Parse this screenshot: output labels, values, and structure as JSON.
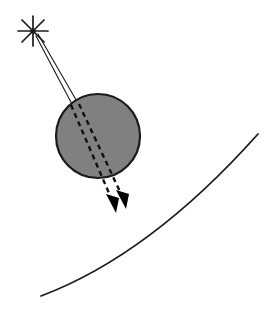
{
  "figure": {
    "name": "ray-diagram-star-body-surface",
    "background_color": "#ffffff",
    "width": 275,
    "height": 310
  },
  "colors": {
    "stroke": "#1a1a1a",
    "body_fill": "#808080",
    "body_stroke": "#1a1a1a",
    "arrowhead_fill": "#000000",
    "background": "#ffffff"
  },
  "star_source": {
    "label": "star-source",
    "center_x": 33,
    "center_y": 31,
    "ray_count": 8,
    "ray_length": 15,
    "stroke_width": 1.6,
    "ray_angles_deg": [
      0,
      45,
      90,
      135,
      180,
      225,
      270,
      315
    ]
  },
  "incident_rays": {
    "label": "incident-light-rays",
    "count": 2,
    "stroke_width": 1.1,
    "ray_a": {
      "x1": 36,
      "y1": 36,
      "x2": 73,
      "y2": 106
    },
    "ray_b": {
      "x1": 38,
      "y1": 34,
      "x2": 79,
      "y2": 105
    }
  },
  "body": {
    "label": "spherical-body",
    "center_x": 98,
    "center_y": 136,
    "radius": 42,
    "fill": "#808080",
    "stroke_width": 2.2
  },
  "refracted_rays": {
    "label": "refracted-dashed-rays",
    "count": 2,
    "stroke_width": 2.4,
    "dash_pattern": "5,4",
    "ray_a": {
      "x1": 71,
      "y1": 105,
      "x2": 114,
      "y2": 205
    },
    "ray_b": {
      "x1": 79,
      "y1": 104,
      "x2": 124,
      "y2": 201
    }
  },
  "arrowheads": {
    "label": "ray-arrowheads",
    "count": 2,
    "fill": "#000000",
    "arrow_a": {
      "tip_x": 116,
      "tip_y": 212,
      "angle_deg": 66
    },
    "arrow_b": {
      "tip_x": 126,
      "tip_y": 208,
      "angle_deg": 66
    }
  },
  "surface_arc": {
    "label": "curved-surface-horizon",
    "stroke_width": 1.8,
    "start_x": 41,
    "start_y": 296,
    "control_x": 150,
    "control_y": 255,
    "end_x": 258,
    "end_y": 134
  }
}
